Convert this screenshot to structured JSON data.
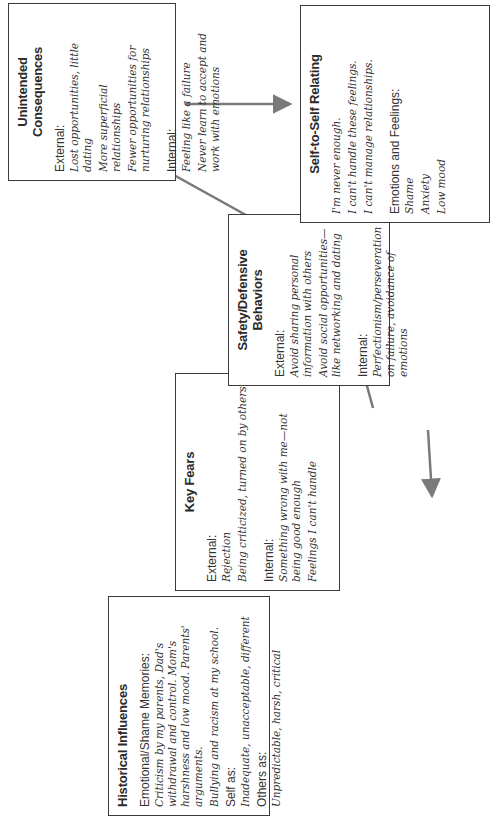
{
  "diagram": {
    "type": "flow",
    "arrow_color": "#7a7a7a",
    "boxes": {
      "historical": {
        "title": "Historical Influences",
        "sections": [
          {
            "label": "Emotional/Shame Memories:",
            "items": [
              "Criticism by my parents, Dad's withdrawal and control. Mom's harshness and low mood. Parents' arguments.",
              "Bullying and racism at my school."
            ]
          },
          {
            "label": "Self as:",
            "items": [
              "Inadequate, unacceptable, different"
            ]
          },
          {
            "label": "Others as:",
            "items": [
              "Unpredictable, harsh, critical"
            ]
          }
        ]
      },
      "key_fears": {
        "title": "Key Fears",
        "sections": [
          {
            "label": "External:",
            "items": [
              "Rejection",
              "Being criticized, turned on by others"
            ]
          },
          {
            "label": "Internal:",
            "items": [
              "Something wrong with me—not being good enough",
              "Feelings I can't handle"
            ]
          }
        ]
      },
      "safety": {
        "title": "Safety/Defensive Behaviors",
        "sections": [
          {
            "label": "External:",
            "items": [
              "Avoid sharing personal information with others",
              "Avoid social opportunities—like networking and dating"
            ]
          },
          {
            "label": "Internal:",
            "items": [
              "Perfectionism/perseveration on failure, avoidance of emotions"
            ]
          }
        ]
      },
      "unintended": {
        "title": "Unintended Consequences",
        "sections": [
          {
            "label": "External:",
            "items": [
              "Lost opportunities, little dating",
              "More superficial relationships",
              "Fewer opportunities for nurturing relationships"
            ]
          },
          {
            "label": "Internal:",
            "items": [
              "Feeling like a failure",
              "Never learn to accept and work with emotions"
            ]
          }
        ]
      },
      "self_relating": {
        "title": "Self-to-Self Relating",
        "statements": [
          "I'm never enough.",
          "I can't handle these feelings.",
          "I can't manage relationships."
        ],
        "sections": [
          {
            "label": "Emotions and Feelings:",
            "items": [
              "Shame",
              "Anxiety",
              "Low mood"
            ]
          }
        ]
      }
    },
    "connections": [
      {
        "from": "historical",
        "to": "key_fears"
      },
      {
        "from": "key_fears",
        "to": "safety"
      },
      {
        "from": "safety",
        "to": "unintended"
      },
      {
        "from": "unintended",
        "to": "self_relating"
      },
      {
        "from": "self_relating",
        "to": "safety"
      },
      {
        "from": "self_relating",
        "to": "key_fears"
      }
    ]
  }
}
